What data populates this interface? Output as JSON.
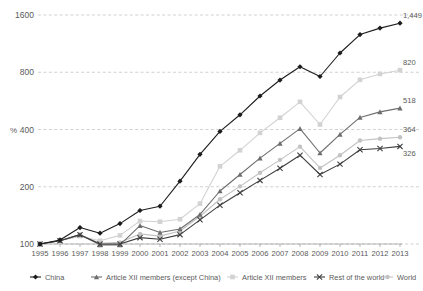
{
  "chart_data": {
    "type": "line",
    "title": "",
    "xlabel": "",
    "ylabel": "%",
    "yscale": "log",
    "ylim": [
      100,
      1600
    ],
    "ytick_labels": [
      "100",
      "200",
      "400",
      "800",
      "1600"
    ],
    "ytick_values": [
      100,
      200,
      400,
      800,
      1600
    ],
    "grid": true,
    "legend_position": "bottom",
    "categories": [
      "1995",
      "1996",
      "1997",
      "1998",
      "1999",
      "2000",
      "2001",
      "2002",
      "2003",
      "2004",
      "2005",
      "2006",
      "2007",
      "2008",
      "2009",
      "2010",
      "2011",
      "2012",
      "2013"
    ],
    "series": [
      {
        "name": "China",
        "color": "#1c1c1c",
        "marker": "diamond",
        "end_label": "1,449",
        "values": [
          100,
          105,
          122,
          114,
          128,
          150,
          158,
          214,
          296,
          391,
          478,
          600,
          728,
          855,
          760,
          1010,
          1262,
          1365,
          1449
        ]
      },
      {
        "name": "Article XII members (except China)",
        "color": "#6e6e6e",
        "marker": "triangle",
        "end_label": "518",
        "values": [
          100,
          104,
          112,
          99,
          99,
          125,
          115,
          120,
          143,
          190,
          232,
          283,
          338,
          404,
          301,
          377,
          463,
          495,
          518
        ]
      },
      {
        "name": "Article XII members",
        "color": "#d2d2d2",
        "marker": "square",
        "end_label": "820",
        "values": [
          100,
          104,
          110,
          104,
          111,
          132,
          131,
          135,
          163,
          256,
          311,
          384,
          461,
          559,
          425,
          593,
          730,
          784,
          820
        ]
      },
      {
        "name": "Rest of the world",
        "color": "#3f3f3f",
        "marker": "x",
        "end_label": "326",
        "values": [
          100,
          104,
          112,
          100,
          100,
          108,
          106,
          112,
          134,
          160,
          186,
          216,
          250,
          293,
          232,
          263,
          313,
          318,
          326
        ]
      },
      {
        "name": "World",
        "color": "#c2c2c2",
        "marker": "circle",
        "end_label": "364",
        "values": [
          100,
          104,
          111,
          101,
          102,
          113,
          110,
          117,
          140,
          172,
          201,
          237,
          277,
          325,
          251,
          293,
          350,
          358,
          364
        ]
      }
    ]
  },
  "legend": {
    "items": [
      {
        "label": "China"
      },
      {
        "label": "Article XII members (except China)"
      },
      {
        "label": "Article XII members"
      },
      {
        "label": "Rest of the world"
      },
      {
        "label": "World"
      }
    ]
  },
  "axis": {
    "y_unit_label": "%"
  }
}
